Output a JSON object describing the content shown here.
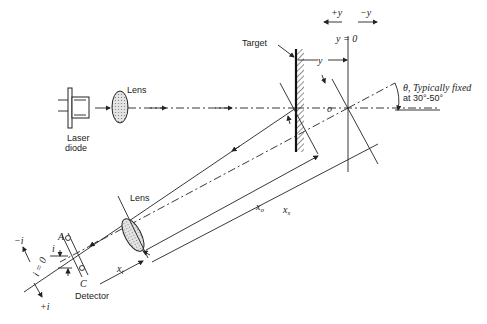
{
  "diagram": {
    "type": "laser-triangulation-schematic",
    "labels": {
      "laser_diode": [
        "Laser",
        "diode"
      ],
      "lens_top": "Lens",
      "lens_bottom": "Lens",
      "target": "Target",
      "plus_y": "+y",
      "minus_y": "−y",
      "y_zero": "y = 0",
      "y_dim": "y",
      "o": "o",
      "theta_line1": "θ, Typically fixed",
      "theta_line2": "at 30°-50°",
      "x_o": "x",
      "x_o_sub": "o",
      "x_s": "x",
      "x_s_sub": "s",
      "x_i": "x",
      "x_i_sub": "i",
      "A": "A",
      "C": "C",
      "i_dim": "i",
      "i_zero": "i = 0",
      "minus_i": "−i",
      "plus_i": "+i",
      "detector": "Detector"
    },
    "colors": {
      "line": "#222222",
      "lens_fill": "#d8d8d8",
      "background": "#ffffff"
    }
  }
}
